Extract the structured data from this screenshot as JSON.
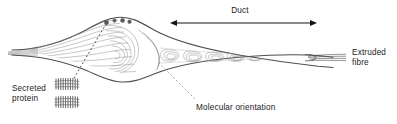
{
  "figure": {
    "background_color": "#ffffff",
    "line_color": "#6e6e6e",
    "outline_color": "#4a4a4a",
    "text_color": "#1a1a1a",
    "width": 397,
    "height": 124
  },
  "labels": {
    "duct": "Duct",
    "extruded_fibre": "Extruded\nfibre",
    "secreted_protein": "Secreted\nprotein",
    "molecular_orientation": "Molecular orientation"
  },
  "annotations": {
    "duct_arrow": {
      "type": "double-headed-arrow",
      "x_start": 176,
      "x_end": 311,
      "y": 23
    },
    "molecular_orientation_leader": {
      "type": "dotted-leader",
      "from_x": 160,
      "from_y": 64,
      "to_x": 194,
      "to_y": 99
    },
    "secreted_protein_leader": {
      "type": "dotted-leader",
      "from_x": 106,
      "from_y": 21,
      "to_x": 74,
      "to_y": 78
    }
  },
  "glyphs": {
    "protein_coil_count": 2,
    "vesicle_count": 4,
    "protein_coil_color": "#6a6a6a"
  }
}
